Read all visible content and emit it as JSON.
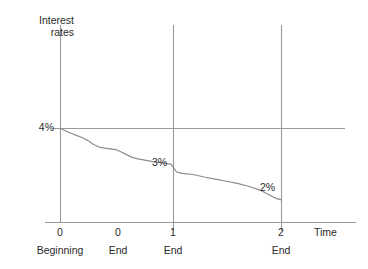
{
  "chart_data": {
    "type": "line",
    "title": "",
    "subtitle": "",
    "ylabel_line1": "Interest",
    "ylabel_line2": "rates",
    "xlabel": "Time",
    "grid": false,
    "legend": "none",
    "xlim": [
      0,
      2.45
    ],
    "ylim": [
      1.55,
      5.3
    ],
    "x_ticks": [
      {
        "value": 0,
        "label": "0",
        "sublabel": "Beginning"
      },
      {
        "value": 0.5,
        "label": "0",
        "sublabel": "End"
      },
      {
        "value": 1,
        "label": "1",
        "sublabel": "End"
      },
      {
        "value": 2,
        "label": "2",
        "sublabel": "End"
      }
    ],
    "y_ticks": [
      {
        "value": 4,
        "label": "4%"
      }
    ],
    "reference_lines": {
      "horizontal": [
        {
          "value": 4,
          "label": "4%"
        }
      ],
      "vertical": [
        {
          "value": 1,
          "label": "1"
        },
        {
          "value": 2,
          "label": "2"
        }
      ]
    },
    "annotations": [
      {
        "label": "3%",
        "x": 1.0,
        "y": 3.0
      },
      {
        "label": "2%",
        "x": 2.0,
        "y": 2.0
      }
    ],
    "series": [
      {
        "name": "Interest rate path",
        "color": "#8c8c8c",
        "x": [
          0.0,
          0.05,
          0.1,
          0.15,
          0.2,
          0.25,
          0.3,
          0.35,
          0.4,
          0.45,
          0.5,
          0.55,
          0.6,
          0.65,
          0.7,
          0.75,
          0.8,
          0.85,
          0.9,
          0.95,
          1.0,
          1.05,
          1.1,
          1.2,
          1.3,
          1.4,
          1.5,
          1.6,
          1.7,
          1.8,
          1.9,
          1.95,
          2.0
        ],
        "y": [
          4.0,
          3.93,
          3.86,
          3.8,
          3.74,
          3.66,
          3.55,
          3.48,
          3.45,
          3.43,
          3.41,
          3.34,
          3.26,
          3.19,
          3.15,
          3.12,
          3.09,
          3.06,
          3.04,
          3.02,
          3.0,
          2.78,
          2.74,
          2.71,
          2.64,
          2.58,
          2.52,
          2.46,
          2.38,
          2.28,
          2.12,
          2.04,
          2.0
        ]
      }
    ]
  },
  "axis_style": {
    "axis_color": "#8c8c8c",
    "text_color": "#2b2b2b",
    "background": "#ffffff"
  }
}
